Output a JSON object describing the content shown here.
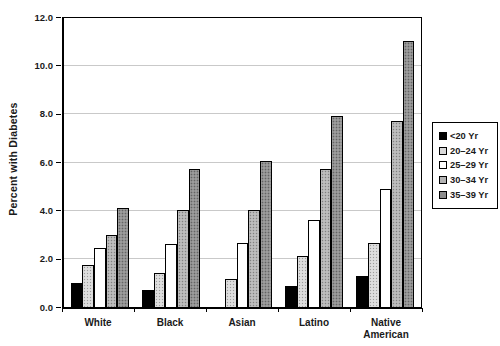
{
  "chart_data": {
    "type": "bar",
    "title": "",
    "xlabel": "",
    "ylabel": "Percent with Diabetes",
    "ylim": [
      0,
      12
    ],
    "ytick_step": 2,
    "yticks": [
      "0.0",
      "2.0",
      "4.0",
      "6.0",
      "8.0",
      "10.0",
      "12.0"
    ],
    "categories": [
      "White",
      "Black",
      "Asian",
      "Latino",
      "Native American"
    ],
    "series": [
      {
        "name": "<20 Yr",
        "color": "#000000",
        "pattern": false,
        "values": [
          1.0,
          0.7,
          0,
          0.85,
          1.3
        ]
      },
      {
        "name": "20–24 Yr",
        "color": "#d9d9d9",
        "pattern": true,
        "values": [
          1.75,
          1.4,
          1.15,
          2.1,
          2.65
        ]
      },
      {
        "name": "25–29 Yr",
        "color": "#ffffff",
        "pattern": false,
        "values": [
          2.45,
          2.6,
          2.65,
          3.6,
          4.9
        ]
      },
      {
        "name": "30–34 Yr",
        "color": "#b3b3b3",
        "pattern": true,
        "values": [
          3.0,
          4.0,
          4.0,
          5.7,
          7.7
        ]
      },
      {
        "name": "35–39 Yr",
        "color": "#8c8c8c",
        "pattern": true,
        "values": [
          4.1,
          5.7,
          6.05,
          7.9,
          11.0
        ]
      }
    ],
    "legend_position": "right",
    "grid": true,
    "gridline_color": "#c9c9c9",
    "axis_color": "#000000",
    "background": "#ffffff"
  }
}
